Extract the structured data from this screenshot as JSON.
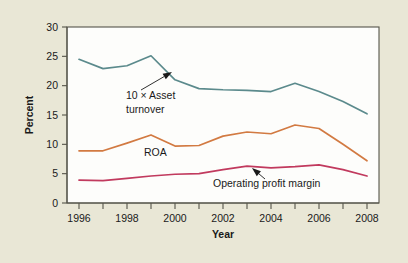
{
  "chart_data": {
    "type": "line",
    "title": "",
    "xlabel": "Year",
    "ylabel": "Percent",
    "xlim": [
      1995.5,
      2008.5
    ],
    "ylim": [
      0,
      30
    ],
    "grid": false,
    "legend_position": "inline-annotations",
    "x": [
      1996,
      1997,
      1998,
      1999,
      2000,
      2001,
      2002,
      2003,
      2004,
      2005,
      2006,
      2007,
      2008
    ],
    "y_ticks": [
      0,
      5,
      10,
      15,
      20,
      25,
      30
    ],
    "y_tick_labels": [
      "0",
      "5",
      "10",
      "15",
      "20",
      "25",
      "30"
    ],
    "x_ticks": [
      1996,
      1997,
      1998,
      1999,
      2000,
      2001,
      2002,
      2003,
      2004,
      2005,
      2006,
      2007,
      2008
    ],
    "x_tick_labels": [
      "1996",
      "",
      "1998",
      "",
      "2000",
      "",
      "2002",
      "",
      "2004",
      "",
      "2006",
      "",
      "2008"
    ],
    "series": [
      {
        "name": "10 × Asset turnover",
        "color": "#5b8a8c",
        "values": [
          24.5,
          22.9,
          23.4,
          25.1,
          21.0,
          19.5,
          19.3,
          19.2,
          19.0,
          20.4,
          19.0,
          17.3,
          15.2
        ]
      },
      {
        "name": "ROA",
        "color": "#d27a42",
        "values": [
          8.9,
          8.9,
          10.2,
          11.6,
          9.7,
          9.8,
          11.4,
          12.1,
          11.8,
          13.3,
          12.7,
          10.0,
          7.2
        ]
      },
      {
        "name": "Operating profit margin",
        "color": "#c13a5e",
        "values": [
          3.9,
          3.8,
          4.2,
          4.6,
          4.9,
          5.0,
          5.7,
          6.3,
          6.0,
          6.2,
          6.5,
          5.7,
          4.6
        ]
      }
    ],
    "annotations": [
      {
        "id": "asset-turnover",
        "text_lines": [
          "10 × Asset",
          "turnover"
        ],
        "text_x": 126,
        "text_y": 99,
        "arrow_from_x": 141,
        "arrow_from_y": 90,
        "arrow_to_x": 172,
        "arrow_to_y": 72
      },
      {
        "id": "roa",
        "text_lines": [
          "ROA"
        ],
        "text_x": 144,
        "text_y": 156,
        "arrow_from_x": null,
        "arrow_from_y": null,
        "arrow_to_x": null,
        "arrow_to_y": null
      },
      {
        "id": "operating-profit-margin",
        "text_lines": [
          "Operating profit margin"
        ],
        "text_x": 213,
        "text_y": 187,
        "arrow_from_x": 265,
        "arrow_from_y": 179,
        "arrow_to_x": 252,
        "arrow_to_y": 168
      }
    ]
  },
  "figure": {
    "background_color": "#e9e7d6",
    "plot_background_color": "#fdfdfb",
    "axis_color": "#55544a"
  },
  "axes": {
    "y_axis_title": "Percent",
    "x_axis_title": "Year"
  }
}
